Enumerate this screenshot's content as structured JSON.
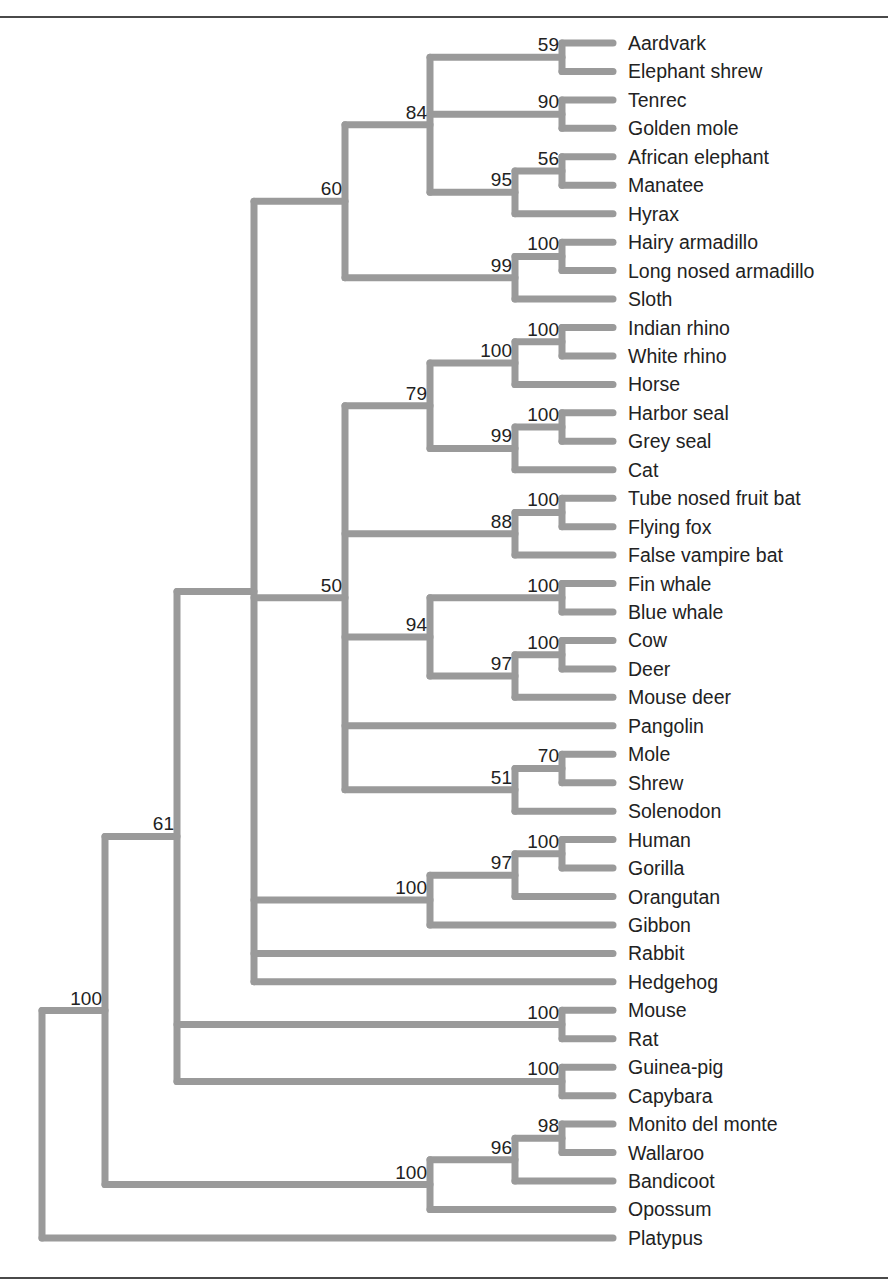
{
  "figure": {
    "type": "phylogenetic-tree",
    "orientation": "left-to-right",
    "branch_color": "#9a9a9a",
    "text_color": "#222222",
    "taxa": [
      "Aardvark",
      "Elephant shrew",
      "Tenrec",
      "Golden mole",
      "African elephant",
      "Manatee",
      "Hyrax",
      "Hairy armadillo",
      "Long nosed armadillo",
      "Sloth",
      "Indian rhino",
      "White rhino",
      "Horse",
      "Harbor seal",
      "Grey seal",
      "Cat",
      "Tube nosed fruit bat",
      "Flying fox",
      "False vampire bat",
      "Fin whale",
      "Blue whale",
      "Cow",
      "Deer",
      "Mouse deer",
      "Pangolin",
      "Mole",
      "Shrew",
      "Solenodon",
      "Human",
      "Gorilla",
      "Orangutan",
      "Gibbon",
      "Rabbit",
      "Hedgehog",
      "Mouse",
      "Rat",
      "Guinea-pig",
      "Capybara",
      "Monito del monte",
      "Wallaroo",
      "Bandicoot",
      "Opossum",
      "Platypus"
    ],
    "tree": {
      "x": 42,
      "children": [
        {
          "x": 105,
          "support": "100",
          "children": [
            {
              "x": 177,
              "support": "61",
              "children": [
                {
                  "x": 254,
                  "children": [
                    {
                      "x": 345,
                      "support": "60",
                      "children": [
                        {
                          "x": 430,
                          "support": "84",
                          "children": [
                            {
                              "x": 562,
                              "support": "59",
                              "children": [
                                {
                                  "leaf": 0
                                },
                                {
                                  "leaf": 1
                                }
                              ]
                            },
                            {
                              "x": 562,
                              "support": "90",
                              "children": [
                                {
                                  "leaf": 2
                                },
                                {
                                  "leaf": 3
                                }
                              ]
                            },
                            {
                              "x": 515,
                              "support": "95",
                              "children": [
                                {
                                  "x": 562,
                                  "support": "56",
                                  "children": [
                                    {
                                      "leaf": 4
                                    },
                                    {
                                      "leaf": 5
                                    }
                                  ]
                                },
                                {
                                  "leaf": 6
                                }
                              ]
                            }
                          ]
                        },
                        {
                          "x": 515,
                          "support": "99",
                          "children": [
                            {
                              "x": 562,
                              "support": "100",
                              "children": [
                                {
                                  "leaf": 7
                                },
                                {
                                  "leaf": 8
                                }
                              ]
                            },
                            {
                              "leaf": 9
                            }
                          ]
                        }
                      ]
                    },
                    {
                      "x": 345,
                      "support": "50",
                      "children": [
                        {
                          "x": 430,
                          "support": "79",
                          "children": [
                            {
                              "x": 515,
                              "support": "100",
                              "children": [
                                {
                                  "x": 562,
                                  "support": "100",
                                  "children": [
                                    {
                                      "leaf": 10
                                    },
                                    {
                                      "leaf": 11
                                    }
                                  ]
                                },
                                {
                                  "leaf": 12
                                }
                              ]
                            },
                            {
                              "x": 515,
                              "support": "99",
                              "children": [
                                {
                                  "x": 562,
                                  "support": "100",
                                  "children": [
                                    {
                                      "leaf": 13
                                    },
                                    {
                                      "leaf": 14
                                    }
                                  ]
                                },
                                {
                                  "leaf": 15
                                }
                              ]
                            }
                          ]
                        },
                        {
                          "x": 515,
                          "support": "88",
                          "children": [
                            {
                              "x": 562,
                              "support": "100",
                              "children": [
                                {
                                  "leaf": 16
                                },
                                {
                                  "leaf": 17
                                }
                              ]
                            },
                            {
                              "leaf": 18
                            }
                          ]
                        },
                        {
                          "x": 430,
                          "support": "94",
                          "children": [
                            {
                              "x": 562,
                              "support": "100",
                              "children": [
                                {
                                  "leaf": 19
                                },
                                {
                                  "leaf": 20
                                }
                              ]
                            },
                            {
                              "x": 515,
                              "support": "97",
                              "children": [
                                {
                                  "x": 562,
                                  "support": "100",
                                  "children": [
                                    {
                                      "leaf": 21
                                    },
                                    {
                                      "leaf": 22
                                    }
                                  ]
                                },
                                {
                                  "leaf": 23
                                }
                              ]
                            }
                          ]
                        },
                        {
                          "leaf": 24
                        },
                        {
                          "x": 515,
                          "support": "51",
                          "children": [
                            {
                              "x": 562,
                              "support": "70",
                              "children": [
                                {
                                  "leaf": 25
                                },
                                {
                                  "leaf": 26
                                }
                              ]
                            },
                            {
                              "leaf": 27
                            }
                          ]
                        }
                      ]
                    },
                    {
                      "x": 430,
                      "support": "100",
                      "children": [
                        {
                          "x": 515,
                          "support": "97",
                          "children": [
                            {
                              "x": 562,
                              "support": "100",
                              "children": [
                                {
                                  "leaf": 28
                                },
                                {
                                  "leaf": 29
                                }
                              ]
                            },
                            {
                              "leaf": 30
                            }
                          ]
                        },
                        {
                          "leaf": 31
                        }
                      ]
                    },
                    {
                      "leaf": 32
                    },
                    {
                      "leaf": 33
                    }
                  ]
                },
                {
                  "x": 562,
                  "support": "100",
                  "children": [
                    {
                      "leaf": 34
                    },
                    {
                      "leaf": 35
                    }
                  ]
                },
                {
                  "x": 562,
                  "support": "100",
                  "children": [
                    {
                      "leaf": 36
                    },
                    {
                      "leaf": 37
                    }
                  ]
                }
              ]
            },
            {
              "x": 430,
              "support": "100",
              "children": [
                {
                  "x": 515,
                  "support": "96",
                  "children": [
                    {
                      "x": 562,
                      "support": "98",
                      "children": [
                        {
                          "leaf": 38
                        },
                        {
                          "leaf": 39
                        }
                      ]
                    },
                    {
                      "leaf": 40
                    }
                  ]
                },
                {
                  "leaf": 41
                }
              ]
            }
          ]
        },
        {
          "leaf": 42
        }
      ]
    }
  }
}
